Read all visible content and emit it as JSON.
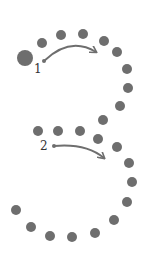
{
  "diagram": {
    "colors": {
      "dot": "#6e6e6e",
      "arrow": "#6e6e6e",
      "label": "#333333",
      "background": "#ffffff"
    },
    "start_dot": {
      "x": 25,
      "y": 58,
      "r": 8
    },
    "stroke1_dots": [
      {
        "x": 42,
        "y": 43
      },
      {
        "x": 61,
        "y": 35
      },
      {
        "x": 83,
        "y": 34
      },
      {
        "x": 104,
        "y": 41
      },
      {
        "x": 117,
        "y": 52
      },
      {
        "x": 127,
        "y": 69
      },
      {
        "x": 128,
        "y": 88
      },
      {
        "x": 120,
        "y": 106
      },
      {
        "x": 103,
        "y": 120
      }
    ],
    "stroke2_dots": [
      {
        "x": 38,
        "y": 131
      },
      {
        "x": 58,
        "y": 131
      },
      {
        "x": 80,
        "y": 131
      },
      {
        "x": 98,
        "y": 139
      },
      {
        "x": 117,
        "y": 147
      },
      {
        "x": 129,
        "y": 163
      },
      {
        "x": 132,
        "y": 182
      },
      {
        "x": 127,
        "y": 202
      },
      {
        "x": 114,
        "y": 220
      },
      {
        "x": 95,
        "y": 233
      },
      {
        "x": 72,
        "y": 237
      },
      {
        "x": 50,
        "y": 236
      },
      {
        "x": 31,
        "y": 227
      },
      {
        "x": 16,
        "y": 210
      }
    ],
    "arrows": [
      {
        "label": "1",
        "label_x": 34,
        "label_y": 73,
        "path": "M44 61 Q 70 36 96 52",
        "head_x": 96,
        "head_y": 52
      },
      {
        "label": "2",
        "label_x": 40,
        "label_y": 150,
        "path": "M54 146 Q 86 143 104 158",
        "head_x": 104,
        "head_y": 158
      }
    ]
  }
}
